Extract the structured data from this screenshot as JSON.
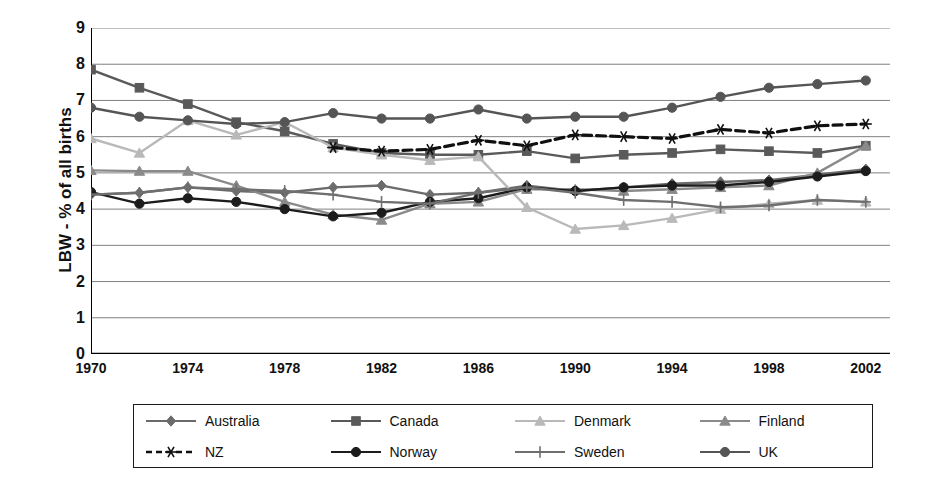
{
  "chart_data": {
    "type": "line",
    "title": "",
    "xlabel": "",
    "ylabel": "LBW - % of all births",
    "xlim": [
      1970,
      2003
    ],
    "ylim": [
      0,
      9
    ],
    "grid": true,
    "legend_position": "bottom",
    "ytick_labels": [
      "0",
      "1",
      "2",
      "3",
      "4",
      "5",
      "6",
      "7",
      "8",
      "9"
    ],
    "ytick_values": [
      0,
      1,
      2,
      3,
      4,
      5,
      6,
      7,
      8,
      9
    ],
    "xtick_labels": [
      "1970",
      "1974",
      "1978",
      "1982",
      "1986",
      "1990",
      "1994",
      "1998",
      "2002"
    ],
    "xtick_values": [
      1970,
      1974,
      1978,
      1982,
      1986,
      1990,
      1994,
      1998,
      2002
    ],
    "x": [
      1970,
      1972,
      1974,
      1976,
      1978,
      1980,
      1982,
      1984,
      1986,
      1988,
      1990,
      1992,
      1994,
      1996,
      1998,
      2000,
      2002
    ],
    "series": [
      {
        "name": "Australia",
        "color": "#6b6b6b",
        "marker": "diamond",
        "dash": false,
        "values": [
          4.4,
          4.45,
          4.6,
          4.5,
          4.45,
          4.6,
          4.65,
          4.4,
          4.45,
          4.65,
          4.5,
          4.6,
          4.7,
          4.75,
          4.8,
          4.95,
          5.1
        ]
      },
      {
        "name": "Canada",
        "color": "#5a5a5a",
        "marker": "square",
        "dash": false,
        "values": [
          7.85,
          7.35,
          6.9,
          6.4,
          6.15,
          5.8,
          5.55,
          5.5,
          5.5,
          5.6,
          5.4,
          5.5,
          5.55,
          5.65,
          5.6,
          5.55,
          5.75
        ]
      },
      {
        "name": "Denmark",
        "color": "#b9b9b9",
        "marker": "triangle",
        "dash": false,
        "values": [
          5.95,
          5.55,
          6.45,
          6.05,
          6.4,
          5.7,
          5.5,
          5.35,
          5.45,
          4.05,
          3.45,
          3.55,
          3.75,
          4.0,
          4.15,
          4.25,
          4.2
        ]
      },
      {
        "name": "Finland",
        "color": "#8a8a8a",
        "marker": "triangle",
        "dash": false,
        "values": [
          5.07,
          5.05,
          5.05,
          4.65,
          4.2,
          3.85,
          3.7,
          4.15,
          4.2,
          4.55,
          4.55,
          4.5,
          4.55,
          4.6,
          4.65,
          5.0,
          5.75
        ]
      },
      {
        "name": "NZ",
        "color": "#101010",
        "marker": "asterisk",
        "dash": true,
        "values": [
          null,
          null,
          null,
          null,
          null,
          5.7,
          5.6,
          5.65,
          5.9,
          5.75,
          6.05,
          6.0,
          5.95,
          6.2,
          6.1,
          6.3,
          6.35
        ]
      },
      {
        "name": "Norway",
        "color": "#1c1c1c",
        "marker": "circle",
        "dash": false,
        "values": [
          4.47,
          4.15,
          4.3,
          4.2,
          4.0,
          3.8,
          3.9,
          4.2,
          4.3,
          4.6,
          4.5,
          4.6,
          4.65,
          4.65,
          4.75,
          4.9,
          5.05
        ]
      },
      {
        "name": "Sweden",
        "color": "#6f6f6f",
        "marker": "plus",
        "dash": false,
        "values": [
          4.4,
          4.45,
          4.6,
          4.55,
          4.5,
          4.4,
          4.2,
          4.15,
          4.45,
          4.6,
          4.45,
          4.25,
          4.2,
          4.05,
          4.1,
          4.25,
          4.2
        ]
      },
      {
        "name": "UK",
        "color": "#555555",
        "marker": "circle",
        "dash": false,
        "values": [
          6.8,
          6.55,
          6.45,
          6.35,
          6.4,
          6.65,
          6.5,
          6.5,
          6.75,
          6.5,
          6.55,
          6.55,
          6.8,
          7.1,
          7.35,
          7.45,
          7.55
        ]
      }
    ]
  },
  "legend": {
    "rows": [
      [
        {
          "label": "Australia",
          "series": 0
        },
        {
          "label": "Canada",
          "series": 1
        },
        {
          "label": "Denmark",
          "series": 2
        },
        {
          "label": "Finland",
          "series": 3
        }
      ],
      [
        {
          "label": "NZ",
          "series": 4
        },
        {
          "label": "Norway",
          "series": 5
        },
        {
          "label": "Sweden",
          "series": 6
        },
        {
          "label": "UK",
          "series": 7
        }
      ]
    ]
  },
  "axis": {
    "line_color": "#000000",
    "grid_color": "#808080"
  }
}
